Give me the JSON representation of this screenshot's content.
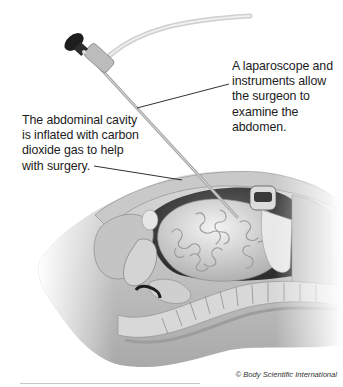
{
  "figure": {
    "callouts": [
      {
        "id": "laparoscope",
        "text": "A laparoscope and instruments allow the surgeon to examine the abdomen."
      },
      {
        "id": "abdominal-cavity",
        "text": "The abdominal cavity is inflated with carbon dioxide gas to help with surgery."
      }
    ],
    "credit": "© Body Scientific International"
  },
  "colors": {
    "background": "#ffffff",
    "text": "#1c1c1c",
    "illustration_mid": "#b5b5b5",
    "illustration_dark": "#2a2a2a",
    "rule": "#c8c8c8"
  }
}
